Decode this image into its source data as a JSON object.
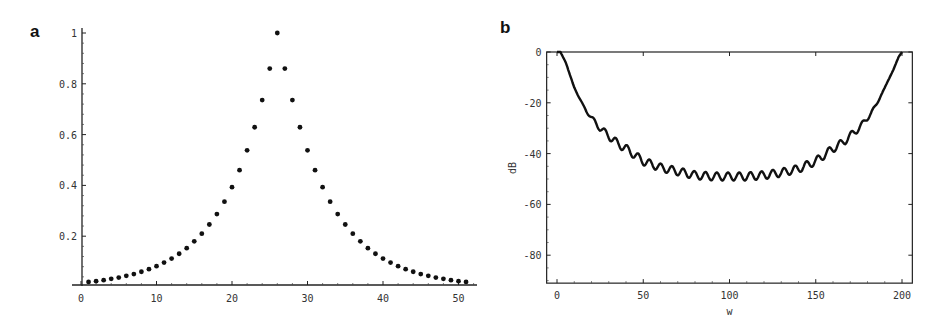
{
  "panels": [
    {
      "label": "a"
    },
    {
      "label": "b"
    }
  ],
  "chart_data": [
    {
      "type": "scatter",
      "panel": "a",
      "title": "",
      "xlabel": "",
      "ylabel": "",
      "xlim": [
        -1,
        53
      ],
      "ylim": [
        0,
        1.02
      ],
      "xticks": [
        0,
        10,
        20,
        30,
        40,
        50
      ],
      "yticks": [
        0.2,
        0.4,
        0.6,
        0.8,
        1
      ],
      "ytick_labels": [
        "0.2",
        "0.4",
        "0.6",
        "0.8",
        "1"
      ],
      "grid": false,
      "x": [
        1,
        2,
        3,
        4,
        5,
        6,
        7,
        8,
        9,
        10,
        11,
        12,
        13,
        14,
        15,
        16,
        17,
        18,
        19,
        20,
        21,
        22,
        23,
        24,
        25,
        26,
        27,
        28,
        29,
        30,
        31,
        32,
        33,
        34,
        35,
        36,
        37,
        38,
        39,
        40,
        41,
        42,
        43,
        44,
        45,
        46,
        47,
        48,
        49,
        50,
        51
      ],
      "values": [
        0.02,
        0.023,
        0.027,
        0.032,
        0.037,
        0.044,
        0.051,
        0.06,
        0.07,
        0.082,
        0.096,
        0.112,
        0.131,
        0.153,
        0.18,
        0.21,
        0.246,
        0.287,
        0.336,
        0.393,
        0.46,
        0.538,
        0.629,
        0.736,
        0.86,
        1.0,
        0.86,
        0.736,
        0.629,
        0.538,
        0.46,
        0.393,
        0.336,
        0.287,
        0.246,
        0.21,
        0.18,
        0.153,
        0.131,
        0.112,
        0.096,
        0.082,
        0.07,
        0.06,
        0.051,
        0.044,
        0.037,
        0.032,
        0.027,
        0.023,
        0.02
      ]
    },
    {
      "type": "line",
      "panel": "b",
      "title": "",
      "xlabel": "w",
      "ylabel": "dB",
      "xlim": [
        -6,
        206
      ],
      "ylim": [
        -91,
        0
      ],
      "xticks": [
        0,
        50,
        100,
        150,
        200
      ],
      "yticks": [
        0,
        -20,
        -40,
        -60,
        -80
      ],
      "grid": false,
      "frame": true,
      "x": [
        0,
        2,
        5,
        10,
        15,
        20,
        25,
        30,
        35,
        40,
        50,
        60,
        70,
        80,
        90,
        100,
        110,
        120,
        130,
        140,
        150,
        160,
        165,
        170,
        175,
        180,
        185,
        190,
        195,
        198,
        200
      ],
      "values": [
        0,
        0,
        -4,
        -14,
        -21,
        -26,
        -30,
        -33,
        -36,
        -38,
        -43,
        -45.5,
        -47,
        -48.5,
        -49,
        -49,
        -49,
        -48.5,
        -47.5,
        -46,
        -43,
        -38,
        -36,
        -33,
        -30,
        -26,
        -21,
        -14,
        -7,
        -2,
        0
      ],
      "ripple_amplitude_db": 1.6,
      "ripple_period_w": 6.5
    }
  ]
}
